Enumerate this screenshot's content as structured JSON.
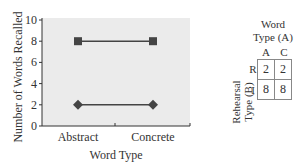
{
  "chart_data": {
    "type": "line",
    "title": "",
    "xlabel": "Word Type",
    "ylabel": "Number of Words Recalled",
    "categories": [
      "Abstract",
      "Concrete"
    ],
    "series": [
      {
        "name": "Imagery (I)",
        "marker": "square",
        "values": [
          8,
          8
        ]
      },
      {
        "name": "Rehearsal (R)",
        "marker": "diamond",
        "values": [
          2,
          2
        ]
      }
    ],
    "ylim": [
      0,
      10
    ],
    "yticks": [
      0,
      2,
      4,
      6,
      8,
      10
    ],
    "grid": false,
    "background": "#ebebeb",
    "line_color": "#444444"
  },
  "table": {
    "title_line1": "Word",
    "title_line2": "Type (A)",
    "row_label": "Rehearsal Type (B)",
    "columns": [
      "A",
      "C"
    ],
    "rows": [
      {
        "label": "R",
        "values": [
          "2",
          "2"
        ]
      },
      {
        "label": "I",
        "values": [
          "8",
          "8"
        ]
      }
    ]
  }
}
